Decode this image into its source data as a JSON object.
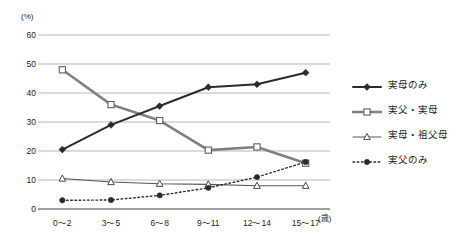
{
  "chart_data": {
    "type": "line",
    "title": "",
    "xlabel": "(歳)",
    "ylabel": "(%)",
    "categories": [
      "0〜2",
      "3〜5",
      "6〜8",
      "9〜11",
      "12〜14",
      "15〜17"
    ],
    "ylim": [
      0,
      60
    ],
    "ytick_labels": [
      "0",
      "10",
      "20",
      "30",
      "40",
      "50",
      "60"
    ],
    "ytick_values": [
      0,
      10,
      20,
      30,
      40,
      50,
      60
    ],
    "grid": "horizontal",
    "legend_position": "right",
    "series": [
      {
        "name": "実母のみ",
        "values": [
          20.5,
          29.0,
          35.5,
          42.0,
          43.0,
          47.0
        ],
        "marker": "filled-diamond",
        "line_style": "solid",
        "color": "#2b2b2b",
        "line_width": 2.0
      },
      {
        "name": "実父・実母",
        "values": [
          48.0,
          36.0,
          30.5,
          20.3,
          21.4,
          15.8
        ],
        "marker": "open-square",
        "line_style": "solid",
        "color": "#808080",
        "line_width": 2.6
      },
      {
        "name": "実母・祖父母",
        "values": [
          10.5,
          9.3,
          8.7,
          8.5,
          8.0,
          8.0
        ],
        "marker": "open-triangle",
        "line_style": "solid",
        "color": "#555555",
        "line_width": 1.1
      },
      {
        "name": "実父のみ",
        "values": [
          3.0,
          3.1,
          4.7,
          7.3,
          11.0,
          16.2
        ],
        "marker": "filled-circle",
        "line_style": "dotted",
        "color": "#2b2b2b",
        "line_width": 1.4
      }
    ]
  },
  "colors": {
    "grid": "#9a9a9a",
    "axis": "#6f6f6f",
    "text": "#231f20"
  }
}
